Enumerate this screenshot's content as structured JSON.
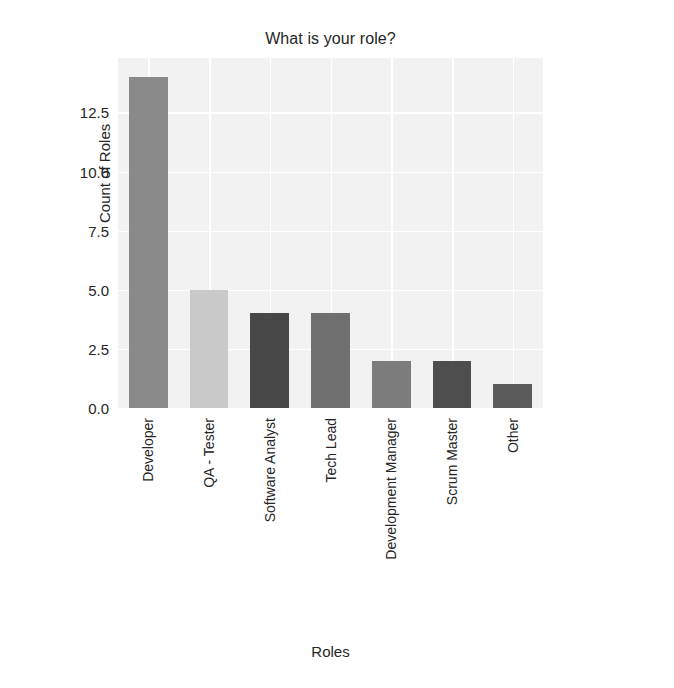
{
  "chart_data": {
    "type": "bar",
    "title": "What is your role?",
    "xlabel": "Roles",
    "ylabel": "Count of Roles",
    "categories": [
      "Developer",
      "QA - Tester",
      "Software Analyst",
      "Tech Lead",
      "Development Manager",
      "Scrum Master",
      "Other"
    ],
    "values": [
      14,
      5,
      4,
      4,
      2,
      2,
      1
    ],
    "bar_colors": [
      "#8a8a8a",
      "#c9c9c9",
      "#474747",
      "#6f6f6f",
      "#7c7c7c",
      "#4e4e4e",
      "#5b5b5b"
    ],
    "ylim": [
      0,
      14.8
    ],
    "yticks": [
      0.0,
      2.5,
      5.0,
      7.5,
      10.0,
      12.5
    ],
    "ytick_labels": [
      "0.0",
      "2.5",
      "5.0",
      "7.5",
      "10.0",
      "12.5"
    ],
    "grid": true,
    "grid_color": "#ffffff",
    "plot_background": "#f2f2f2",
    "legend": null,
    "legend_position": "none"
  },
  "figure": {
    "background": "#ffffff",
    "width": 674,
    "height": 688
  }
}
